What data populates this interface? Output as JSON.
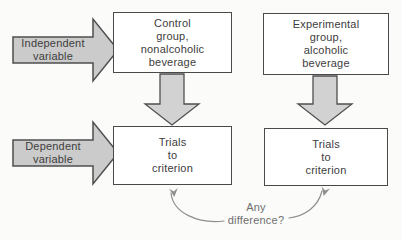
{
  "colors": {
    "background": "#fbfbf9",
    "box_fill": "#ffffff",
    "box_border": "#4a4a4a",
    "arrow_fill": "#cbcbcb",
    "down_arrow_fill": "#d2d2d2",
    "arrow_border": "#4f4f4f",
    "curve_line": "#8f8f8f",
    "text": "#3d3d3d",
    "annotation_text": "#6f6f6f"
  },
  "labels": {
    "independent_variable": "Independent\nvariable",
    "dependent_variable": "Dependent\nvariable"
  },
  "boxes": {
    "control_group": "Control\ngroup,\nnonalcoholic\nbeverage",
    "experimental_group": "Experimental\ngroup,\nalcoholic\nbeverage",
    "trials_control": "Trials\nto\ncriterion",
    "trials_experimental": "Trials\nto\ncriterion"
  },
  "annotation": {
    "any_difference": "Any\ndifference?"
  }
}
